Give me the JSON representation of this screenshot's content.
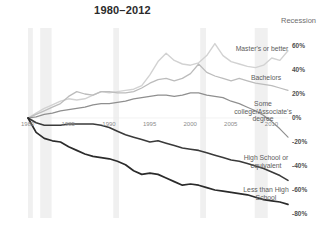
{
  "header": {
    "title": "1980–2012",
    "recession_legend": "Recession"
  },
  "chart_data": {
    "type": "line",
    "title": "1980–2012",
    "xlabel": "",
    "ylabel": "",
    "xlim": [
      1980,
      2012
    ],
    "ylim": [
      -80,
      70
    ],
    "grid": false,
    "legend_position": "inline-right",
    "ytick_labels": [
      "60%",
      "40%",
      "20%",
      "0%",
      "-20%",
      "-40%",
      "-60%",
      "-80%"
    ],
    "ytick_values": [
      60,
      40,
      20,
      0,
      -20,
      -40,
      -60,
      -80
    ],
    "xtick_labels": [
      "1980",
      "1985",
      "1990",
      "1995",
      "2000",
      "2005",
      "2010"
    ],
    "xtick_values": [
      1980,
      1985,
      1990,
      1995,
      2000,
      2005,
      2010
    ],
    "annotations": [
      {
        "label": "Recession",
        "type": "shaded-band-legend"
      }
    ],
    "recession_bands": [
      {
        "start": 1980.0,
        "end": 1980.6
      },
      {
        "start": 1981.5,
        "end": 1982.9
      },
      {
        "start": 1990.5,
        "end": 1991.2
      },
      {
        "start": 2001.2,
        "end": 2001.9
      },
      {
        "start": 2007.9,
        "end": 2009.5
      }
    ],
    "x": [
      1980,
      1981,
      1982,
      1983,
      1984,
      1985,
      1986,
      1987,
      1988,
      1989,
      1990,
      1991,
      1992,
      1993,
      1994,
      1995,
      1996,
      1997,
      1998,
      1999,
      2000,
      2001,
      2002,
      2003,
      2004,
      2005,
      2006,
      2007,
      2008,
      2009,
      2010,
      2011,
      2012
    ],
    "series": [
      {
        "name": "Master's or better",
        "color": "#d2d2d2",
        "width": 1.4,
        "values": [
          0,
          4,
          8,
          11,
          14,
          16,
          15,
          16,
          19,
          22,
          21,
          22,
          23,
          24,
          27,
          36,
          47,
          54,
          48,
          45,
          44,
          46,
          52,
          62,
          52,
          47,
          45,
          43,
          42,
          44,
          50,
          48,
          56
        ]
      },
      {
        "name": "Bachelors",
        "color": "#bcbcbc",
        "width": 1.3,
        "values": [
          0,
          3,
          6,
          9,
          12,
          18,
          22,
          20,
          19,
          22,
          22,
          21,
          21,
          22,
          25,
          29,
          32,
          33,
          31,
          33,
          37,
          45,
          38,
          35,
          33,
          31,
          33,
          31,
          29,
          28,
          27,
          25,
          23
        ]
      },
      {
        "name": "Some college/Associate's degree",
        "color": "#8f8f8f",
        "width": 1.2,
        "values": [
          0,
          1,
          3,
          4,
          6,
          7,
          8,
          9,
          11,
          12,
          12,
          13,
          14,
          16,
          17,
          18,
          19,
          19,
          18,
          19,
          21,
          21,
          19,
          18,
          17,
          14,
          12,
          9,
          6,
          2,
          -3,
          -9,
          -16
        ]
      },
      {
        "name": "High School or equivalent",
        "color": "#3a3a3a",
        "width": 1.6,
        "values": [
          0,
          -4,
          -6,
          -6,
          -6,
          -5,
          -5,
          -5,
          -5,
          -6,
          -8,
          -11,
          -14,
          -16,
          -18,
          -20,
          -19,
          -21,
          -23,
          -25,
          -26,
          -27,
          -29,
          -31,
          -33,
          -35,
          -36,
          -38,
          -40,
          -42,
          -45,
          -48,
          -52
        ]
      },
      {
        "name": "Less than High School",
        "color": "#2b2b2b",
        "width": 1.7,
        "values": [
          0,
          -12,
          -17,
          -19,
          -20,
          -24,
          -27,
          -30,
          -32,
          -33,
          -34,
          -36,
          -39,
          -44,
          -47,
          -46,
          -47,
          -50,
          -53,
          -56,
          -55,
          -56,
          -58,
          -60,
          -61,
          -62,
          -63,
          -64,
          -66,
          -68,
          -69,
          -70,
          -72
        ]
      }
    ],
    "series_labels": [
      {
        "text": "Master's or better",
        "x": 262,
        "y": 45
      },
      {
        "text": "Bachelors",
        "x": 266,
        "y": 74
      },
      {
        "text": "Some\ncollege/Associate's\ndegree",
        "x": 263,
        "y": 100
      },
      {
        "text": "High School or\nequivalent",
        "x": 266,
        "y": 154
      },
      {
        "text": "Less than High\nSchool",
        "x": 266,
        "y": 186
      }
    ]
  }
}
